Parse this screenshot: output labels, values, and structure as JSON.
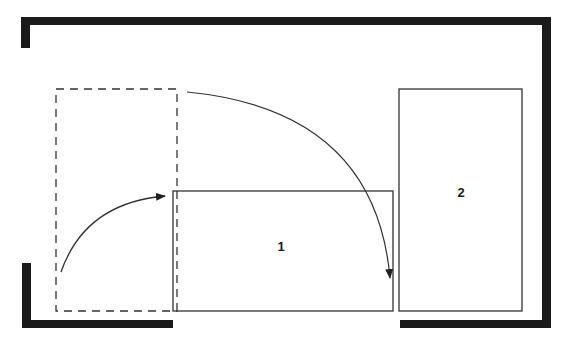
{
  "diagram": {
    "type": "floor-plan-furniture-rearrangement",
    "colors": {
      "wall": "#1a1a1a",
      "line": "#333333",
      "background": "#ffffff"
    },
    "items": [
      {
        "id": "1",
        "label": "1",
        "description": "Rectangle 1 moved from left dashed position to center"
      },
      {
        "id": "2",
        "label": "2",
        "description": "Tall rectangle 2 on right side"
      }
    ],
    "ghost": {
      "description": "Dashed outline showing previous position"
    },
    "arrows": [
      {
        "from": "dashed-position",
        "to": "item-1",
        "direction": "curve up-right"
      },
      {
        "from": "dashed-position-top",
        "to": "item-1-right-edge",
        "direction": "curve down-right"
      }
    ]
  }
}
